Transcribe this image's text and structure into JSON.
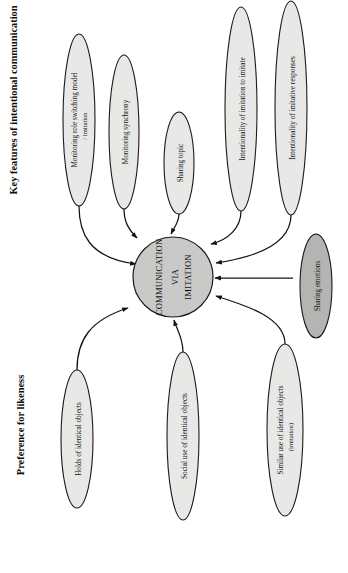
{
  "figure": {
    "orientation": "rotated-90-ccw",
    "canvas": {
      "width": 348,
      "height": 573
    },
    "colors": {
      "hub_fill": "#c9c9c7",
      "node_fill_light": "#e8e8e6",
      "node_fill_dark": "#b4b4b2",
      "stroke": "#1a1a1a",
      "background": "#ffffff",
      "text": "#131313"
    }
  },
  "headings": [
    {
      "id": "heading-intentional",
      "text": "Key features of intentional communication"
    },
    {
      "id": "heading-likeness",
      "text": "Preference for likeness"
    }
  ],
  "hub": {
    "id": "hub-communication-via-imitation",
    "lines": [
      "COMMUNICATION",
      "VIA",
      "IMITATION"
    ]
  },
  "nodes": [
    {
      "id": "node-monitoring-role-switching",
      "group": "Key features of intentional communication",
      "lines": [
        "Monitoring role switching model",
        "/ imitation"
      ],
      "shade": "light"
    },
    {
      "id": "node-monitoring-synchrony",
      "group": "Key features of intentional communication",
      "lines": [
        "Monitoring synchrony"
      ],
      "shade": "light"
    },
    {
      "id": "node-sharing-topic",
      "group": "Key features of intentional communication",
      "lines": [
        "Sharing topic"
      ],
      "shade": "light"
    },
    {
      "id": "node-intentionality-of-imitation-to-imitate",
      "group": "Key features of intentional communication",
      "lines": [
        "Intentionality of imitation to imitate"
      ],
      "shade": "light"
    },
    {
      "id": "node-intentionality-of-imitative-responses",
      "group": "Key features of intentional communication",
      "lines": [
        "Intentionality of imitative responses"
      ],
      "shade": "light"
    },
    {
      "id": "node-sharing-emotions",
      "group": "Key features of intentional communication",
      "lines": [
        "Sharing emotions"
      ],
      "shade": "dark"
    },
    {
      "id": "node-holds-of-identical-objects",
      "group": "Preference for likeness",
      "lines": [
        "Holds of identical objects"
      ],
      "shade": "light"
    },
    {
      "id": "node-social-use-of-identical-objects",
      "group": "Preference for likeness",
      "lines": [
        "Social use of identical objects"
      ],
      "shade": "light"
    },
    {
      "id": "node-similar-use-of-identical-objects",
      "group": "Preference for likeness",
      "lines": [
        "Similar use of identical objects",
        "(imitation)"
      ],
      "shade": "light"
    }
  ],
  "edges": [
    {
      "from": "node-monitoring-role-switching",
      "to": "hub-communication-via-imitation",
      "arrow": "to"
    },
    {
      "from": "node-monitoring-synchrony",
      "to": "hub-communication-via-imitation",
      "arrow": "to"
    },
    {
      "from": "node-sharing-topic",
      "to": "hub-communication-via-imitation",
      "arrow": "to"
    },
    {
      "from": "node-intentionality-of-imitation-to-imitate",
      "to": "hub-communication-via-imitation",
      "arrow": "to"
    },
    {
      "from": "node-intentionality-of-imitative-responses",
      "to": "hub-communication-via-imitation",
      "arrow": "to"
    },
    {
      "from": "node-sharing-emotions",
      "to": "hub-communication-via-imitation",
      "arrow": "to"
    },
    {
      "from": "node-holds-of-identical-objects",
      "to": "hub-communication-via-imitation",
      "arrow": "to"
    },
    {
      "from": "node-social-use-of-identical-objects",
      "to": "hub-communication-via-imitation",
      "arrow": "to"
    },
    {
      "from": "node-similar-use-of-identical-objects",
      "to": "hub-communication-via-imitation",
      "arrow": "to"
    }
  ]
}
